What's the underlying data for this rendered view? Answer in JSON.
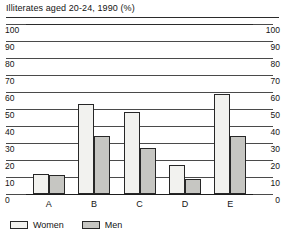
{
  "chart_data": {
    "type": "bar",
    "title": "Illiterates aged 20-24, 1990 (%)",
    "xlabel": "",
    "ylabel": "",
    "ylim": [
      0,
      100
    ],
    "ytick_step": 10,
    "yticks": [
      0,
      10,
      20,
      30,
      40,
      50,
      60,
      70,
      80,
      90,
      100
    ],
    "ytick_labels": [
      "0",
      "10",
      "20",
      "30",
      "40",
      "50",
      "60",
      "70",
      "80",
      "90",
      "100"
    ],
    "dual_axis": true,
    "grid": true,
    "legend_position": "bottom-left",
    "categories": [
      "A",
      "B",
      "C",
      "D",
      "E"
    ],
    "series": [
      {
        "name": "Women",
        "color": "#f2f2ef",
        "values": [
          12,
          53,
          48,
          17,
          59
        ]
      },
      {
        "name": "Men",
        "color": "#c6c6c2",
        "values": [
          11,
          34,
          27,
          9,
          34
        ]
      }
    ]
  },
  "legend": {
    "items": [
      {
        "label": "Women"
      },
      {
        "label": "Men"
      }
    ]
  },
  "colors": {
    "women": "#f2f2ef",
    "men": "#c6c6c2",
    "outline": "#272727",
    "grid": "#4a4a4a",
    "background": "#ffffff"
  }
}
